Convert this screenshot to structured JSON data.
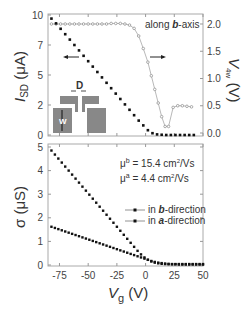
{
  "chart_data": [
    {
      "type": "line",
      "panel": "top",
      "title": "",
      "annotation": "along b-axis",
      "annotation_parts": {
        "prefix": "along ",
        "bold": "b",
        "suffix": "-axis"
      },
      "xlabel": "",
      "ylabel_left": {
        "main": "I",
        "sub": "SD",
        "unit": " (μA)"
      },
      "ylabel_right": {
        "main": "V",
        "sub": "4w",
        "unit": " (V)"
      },
      "xlim": [
        -85,
        50
      ],
      "ylim_left": [
        0,
        10
      ],
      "ylim_right": [
        0,
        2.2
      ],
      "yticks_left": [
        "10",
        "7",
        "5",
        "2",
        "0"
      ],
      "yticks_left_values": [
        10,
        7.5,
        5,
        2.5,
        0
      ],
      "yticks_right": [
        "2.0",
        "1.5",
        "1.0",
        "0.5",
        "0.0"
      ],
      "yticks_right_values": [
        2.0,
        1.5,
        1.0,
        0.5,
        0.0
      ],
      "grid": false,
      "inset_labels": {
        "gap": "D",
        "width": "W"
      },
      "series": [
        {
          "name": "I_SD",
          "axis": "left",
          "marker": "filled-square",
          "x": [
            -82,
            -78,
            -74,
            -70,
            -66,
            -62,
            -58,
            -54,
            -50,
            -46,
            -42,
            -38,
            -34,
            -30,
            -26,
            -22,
            -18,
            -14,
            -10,
            -6,
            -2,
            2,
            6,
            10,
            14,
            18,
            22,
            26,
            30,
            34,
            38,
            42
          ],
          "values": [
            9.7,
            9.3,
            8.85,
            8.4,
            7.95,
            7.5,
            7.05,
            6.6,
            6.15,
            5.7,
            5.25,
            4.8,
            4.35,
            3.9,
            3.45,
            3.0,
            2.55,
            2.1,
            1.65,
            1.2,
            0.8,
            0.4,
            0.15,
            0.05,
            0.02,
            0.0,
            0.0,
            0.0,
            0.0,
            0.0,
            0.0,
            0.0
          ]
        },
        {
          "name": "V_4w",
          "axis": "right",
          "marker": "open-circle",
          "x": [
            -82,
            -78,
            -74,
            -70,
            -66,
            -62,
            -58,
            -54,
            -50,
            -46,
            -42,
            -38,
            -34,
            -30,
            -26,
            -22,
            -18,
            -14,
            -10,
            -6,
            -2,
            2,
            5,
            8,
            11,
            14,
            17,
            20,
            24,
            28,
            32,
            36,
            40
          ],
          "values": [
            2.0,
            2.0,
            2.0,
            2.0,
            2.0,
            2.0,
            2.0,
            2.0,
            2.0,
            2.0,
            2.0,
            2.0,
            2.0,
            2.01,
            2.01,
            2.01,
            2.0,
            1.98,
            1.92,
            1.78,
            1.55,
            1.3,
            1.05,
            0.8,
            0.55,
            0.3,
            0.12,
            0.12,
            0.47,
            0.5,
            0.5,
            0.49,
            0.48
          ]
        }
      ],
      "arrows": [
        {
          "direction": "left",
          "points_to": "left axis"
        },
        {
          "direction": "right",
          "points_to": "right axis"
        }
      ]
    },
    {
      "type": "line",
      "panel": "bottom",
      "title": "",
      "xlabel": {
        "main": "V",
        "sub": "g",
        "unit": " (V)"
      },
      "ylabel": "σ (μS)",
      "xlim": [
        -85,
        50
      ],
      "ylim": [
        0,
        5
      ],
      "xticks": [
        "-75",
        "-50",
        "-25",
        "0",
        "25",
        "50"
      ],
      "xticks_values": [
        -75,
        -50,
        -25,
        0,
        25,
        50
      ],
      "yticks": [
        "5",
        "4",
        "3",
        "2",
        "1",
        "0"
      ],
      "yticks_values": [
        5,
        4,
        3,
        2,
        1,
        0
      ],
      "grid": false,
      "annotations": [
        {
          "symbol": "μ",
          "sup": "b",
          "text": " = 15.4 cm",
          "sup2": "2",
          "tail": "/Vs"
        },
        {
          "symbol": "μ",
          "sup": "a",
          "text": " = 4.4 cm",
          "sup2": "2",
          "tail": "/Vs"
        }
      ],
      "legend": {
        "position": "center-right",
        "entries": [
          {
            "prefix": "in ",
            "bold": "b",
            "suffix": "-direction"
          },
          {
            "prefix": "in ",
            "bold": "a",
            "suffix": "-direction"
          }
        ]
      },
      "series": [
        {
          "name": "in b-direction",
          "x": [
            -82,
            -79,
            -76,
            -73,
            -70,
            -67,
            -64,
            -61,
            -58,
            -55,
            -52,
            -49,
            -46,
            -43,
            -40,
            -37,
            -34,
            -31,
            -28,
            -25,
            -22,
            -19,
            -16,
            -13,
            -10,
            -7,
            -4,
            -1,
            2,
            5,
            8,
            11,
            14,
            17,
            20,
            23,
            26,
            29,
            32,
            35,
            38,
            41,
            44,
            47,
            50
          ],
          "values": [
            4.85,
            4.68,
            4.51,
            4.34,
            4.17,
            4.0,
            3.83,
            3.66,
            3.49,
            3.32,
            3.15,
            2.98,
            2.81,
            2.64,
            2.47,
            2.3,
            2.13,
            1.96,
            1.79,
            1.62,
            1.45,
            1.28,
            1.11,
            0.94,
            0.77,
            0.6,
            0.45,
            0.32,
            0.22,
            0.15,
            0.1,
            0.07,
            0.05,
            0.04,
            0.03,
            0.03,
            0.03,
            0.02,
            0.02,
            0.02,
            0.02,
            0.02,
            0.02,
            0.02,
            0.02
          ]
        },
        {
          "name": "in a-direction",
          "x": [
            -82,
            -79,
            -76,
            -73,
            -70,
            -67,
            -64,
            -61,
            -58,
            -55,
            -52,
            -49,
            -46,
            -43,
            -40,
            -37,
            -34,
            -31,
            -28,
            -25,
            -22,
            -19,
            -16,
            -13,
            -10,
            -7,
            -4,
            -1,
            2,
            5,
            8,
            11,
            14,
            17,
            20,
            23,
            26,
            29,
            32,
            35,
            38,
            41,
            44,
            47,
            50
          ],
          "values": [
            1.62,
            1.57,
            1.52,
            1.47,
            1.42,
            1.37,
            1.32,
            1.27,
            1.22,
            1.17,
            1.12,
            1.07,
            1.02,
            0.97,
            0.92,
            0.87,
            0.82,
            0.77,
            0.72,
            0.67,
            0.62,
            0.57,
            0.52,
            0.47,
            0.42,
            0.37,
            0.32,
            0.27,
            0.22,
            0.17,
            0.13,
            0.1,
            0.08,
            0.06,
            0.05,
            0.04,
            0.04,
            0.04,
            0.04,
            0.04,
            0.04,
            0.04,
            0.04,
            0.04,
            0.04
          ]
        }
      ]
    }
  ],
  "colors": {
    "axis": "#999999",
    "text": "#333333",
    "marker_filled": "#111111",
    "marker_open": "#888888",
    "inset_fill": "#888888"
  }
}
